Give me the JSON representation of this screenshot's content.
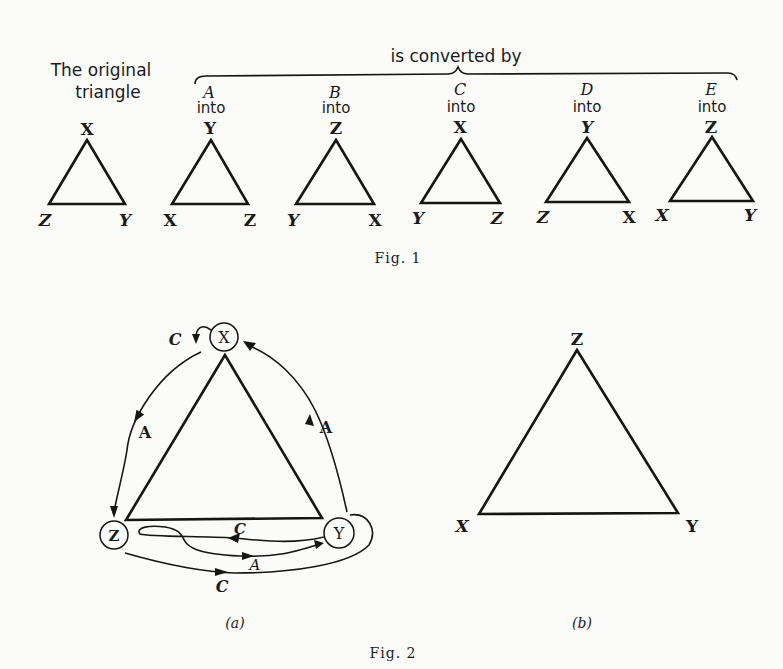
{
  "fig1": {
    "original_label_line1": "The original",
    "original_label_line2": "triangle",
    "brace_label": "is converted by",
    "caption": "Fig. 1",
    "original": {
      "top": "X",
      "left": "Z",
      "right": "Y"
    },
    "conversions": [
      {
        "op": "A",
        "into": "into",
        "top": "Y",
        "left": "X",
        "right": "Z"
      },
      {
        "op": "B",
        "into": "into",
        "top": "Z",
        "left": "Y",
        "right": "X"
      },
      {
        "op": "C",
        "into": "into",
        "top": "X",
        "left": "Y",
        "right": "Z"
      },
      {
        "op": "D",
        "into": "into",
        "top": "Y",
        "left": "Z",
        "right": "X"
      },
      {
        "op": "E",
        "into": "into",
        "top": "Z",
        "left": "X",
        "right": "Y"
      }
    ]
  },
  "fig2": {
    "caption": "Fig. 2",
    "a": {
      "sublabel": "(a)",
      "nodes": {
        "top": "X",
        "left": "Z",
        "right": "Y"
      },
      "arrow_labels": {
        "x_loop": "C",
        "x_to_z": "A",
        "y_to_x": "A",
        "y_to_z_inner": "C",
        "z_to_y_inner": "A",
        "z_to_y_outer": "C"
      }
    },
    "b": {
      "sublabel": "(b)",
      "top": "Z",
      "left": "X",
      "right": "Y"
    }
  }
}
